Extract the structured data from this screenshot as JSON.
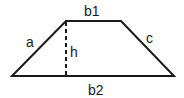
{
  "diagram": {
    "title": "",
    "shape": "trapezoid",
    "labels": {
      "top_base": "b1",
      "bottom_base": "b2",
      "left_side": "a",
      "right_side": "c",
      "height": "h"
    },
    "vertices": {
      "bottom_left": [
        12,
        76
      ],
      "top_left": [
        66,
        21
      ],
      "top_right": [
        121,
        21
      ],
      "bottom_right": [
        174,
        76
      ]
    },
    "colors": {
      "stroke": "#1a1a1a",
      "background": "#ffffff"
    }
  }
}
